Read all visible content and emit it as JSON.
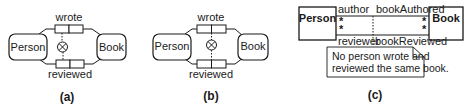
{
  "figure": {
    "panels": [
      {
        "id": "a",
        "caption": "(a)",
        "entities": [
          {
            "label": "Person"
          },
          {
            "label": "Book"
          }
        ],
        "fact_types": [
          {
            "label": "wrote"
          },
          {
            "label": "reviewed"
          }
        ],
        "constraint_symbol": "⊗",
        "constraint_span": "first role (Person)"
      },
      {
        "id": "b",
        "caption": "(b)",
        "entities": [
          {
            "label": "Person"
          },
          {
            "label": "Book"
          }
        ],
        "fact_types": [
          {
            "label": "wrote"
          },
          {
            "label": "reviewed"
          }
        ],
        "constraint_symbol": "⊗",
        "constraint_span": "both roles"
      },
      {
        "id": "c",
        "caption": "(c)",
        "classes": [
          {
            "label": "Person"
          },
          {
            "label": "Book"
          }
        ],
        "roles_top": {
          "left": "author",
          "right": "bookAuthored"
        },
        "roles_bottom": {
          "left": "reviewer",
          "right": "bookReviewed"
        },
        "multiplicity": "*",
        "note_lines": [
          "No person wrote and",
          "reviewed the same book."
        ]
      }
    ]
  },
  "colors": {
    "stroke": "#1a1a1a",
    "background": "#ffffff"
  }
}
